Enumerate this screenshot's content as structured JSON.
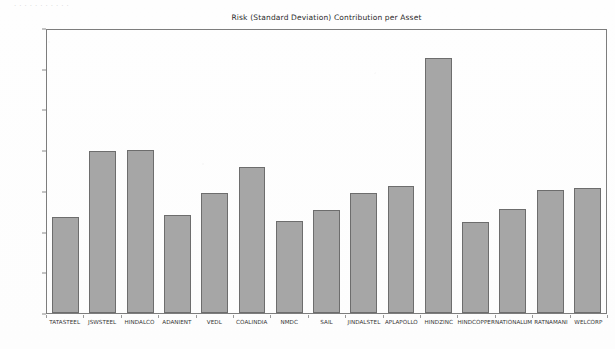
{
  "page": {
    "ghost_header_text": ".  .      .            .              .         .                 .                 .            .       .        ."
  },
  "chart_data": {
    "type": "bar",
    "title": "Risk (Standard Deviation) Contribution per Asset",
    "xlabel": "",
    "ylabel": "",
    "ylim": [
      0,
      3.5
    ],
    "grid": false,
    "legend": null,
    "bar_color": "#a6a6a6",
    "bar_edge_color": "#6d6d6d",
    "axis_color": "#7d7d7d",
    "y_tick_labels": [
      "3.5000%",
      "3.0000%",
      "2.5000%",
      "2.0000%",
      "1.5000%",
      "1.0000%",
      "0.5000%",
      "0.0000%"
    ],
    "y_tick_values": [
      3.5,
      3.0,
      2.5,
      2.0,
      1.5,
      1.0,
      0.5,
      0.0
    ],
    "categories": [
      "TATASTEEL",
      "JSWSTEEL",
      "HINDALCO",
      "ADANIENT",
      "VEDL",
      "COALINDIA",
      "NMDC",
      "SAIL",
      "JINDALSTEL",
      "APLAPOLLO",
      "HINDZINC",
      "HINDCOPPER",
      "NATIONALUM",
      "RATNAMANI",
      "WELCORP"
    ],
    "values": [
      1.19,
      2.0,
      2.01,
      1.21,
      1.49,
      1.81,
      1.14,
      1.28,
      1.49,
      1.57,
      3.15,
      1.13,
      1.29,
      1.52,
      1.55
    ],
    "value_labels": [
      "1.1900%",
      "2.0000%",
      "2.0100%",
      "1.2100%",
      "1.4900%",
      "1.8100%",
      "1.1400%",
      "1.2800%",
      "1.4900%",
      "1.5700%",
      "3.1500%",
      "1.1300%",
      "1.2900%",
      "1.5200%",
      "1.5500%"
    ]
  }
}
